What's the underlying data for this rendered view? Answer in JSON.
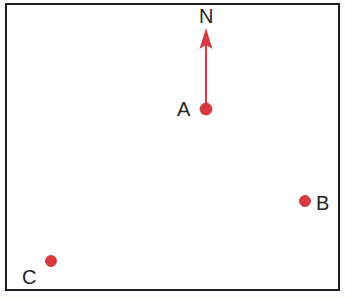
{
  "figure": {
    "type": "point-map-diagram",
    "width": 345,
    "height": 298,
    "background_color": "#fdfdfc",
    "frame": {
      "name": "map-border",
      "color": "#1b1b1b",
      "x": 5,
      "y": 3,
      "width": 335,
      "height": 288,
      "stroke_width": 2.5
    }
  },
  "colors": {
    "marker_red": "#d8383f",
    "marker_red_dark": "#c32b33",
    "label_text": "#232323",
    "frame_black": "#1b1b1b",
    "canvas_white": "#ffffff"
  },
  "points": [
    {
      "label": "A",
      "name": "point-a",
      "x": 206,
      "y": 109,
      "radius": 6,
      "color": "#d8383f",
      "label_x": 184,
      "label_y": 109
    },
    {
      "label": "B",
      "name": "point-b",
      "x": 305,
      "y": 201,
      "radius": 5.5,
      "color": "#d8383f",
      "label_x": 322,
      "label_y": 203
    },
    {
      "label": "C",
      "name": "point-c",
      "x": 51,
      "y": 261,
      "radius": 5.5,
      "color": "#d8383f",
      "label_x": 29,
      "label_y": 277
    }
  ],
  "north_arrow": {
    "name": "north-arrow",
    "label": "N",
    "label_x": 206,
    "label_y": 16,
    "color": "#d8383f",
    "origin_x": 206,
    "origin_y": 109,
    "tip_x": 206,
    "tip_y": 28,
    "shaft_width": 2,
    "head_base_y": 49,
    "head_half_width": 6.5,
    "direction": "up"
  },
  "labels": {
    "north": "N",
    "a": "A",
    "b": "B",
    "c": "C"
  }
}
